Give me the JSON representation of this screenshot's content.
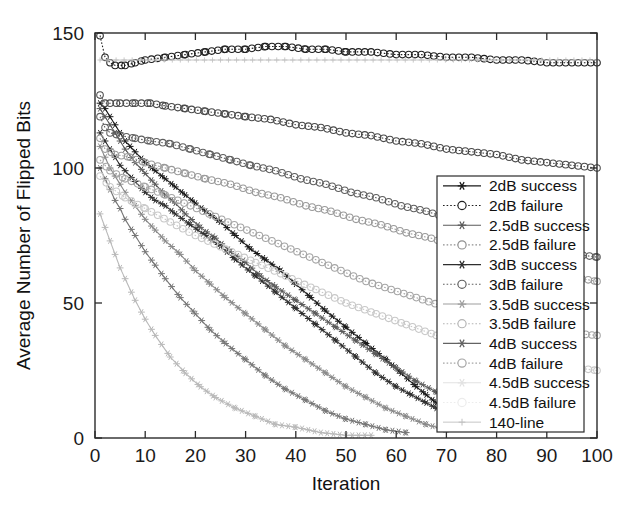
{
  "chart_data": {
    "type": "line",
    "title": "",
    "xlabel": "Iteration",
    "ylabel": "Average Number of Flipped Bits",
    "xlim": [
      0,
      100
    ],
    "ylim": [
      0,
      150
    ],
    "xticks": [
      "0",
      "10",
      "20",
      "30",
      "40",
      "50",
      "60",
      "70",
      "80",
      "90",
      "100"
    ],
    "yticks": [
      "0",
      "50",
      "100",
      "150"
    ],
    "grid": false,
    "legend_position": "right-center",
    "series": [
      {
        "name": "2dB success",
        "marker": "star",
        "linestyle": "solid",
        "color": "#1a1a1a",
        "x": [
          1,
          2,
          3,
          4,
          5,
          6,
          7,
          8,
          10,
          12,
          14,
          16,
          18,
          20,
          22,
          25,
          28,
          31,
          34,
          37,
          40,
          43,
          46,
          50,
          54,
          58,
          61,
          64,
          66,
          68
        ],
        "values": [
          124,
          122,
          119,
          116,
          113,
          110,
          108,
          106,
          102,
          99,
          96,
          93,
          90,
          87,
          84,
          80,
          75,
          70,
          66,
          62,
          57,
          52,
          47,
          41,
          35,
          29,
          24,
          19,
          16,
          13
        ]
      },
      {
        "name": "2dB failure",
        "marker": "circle",
        "linestyle": "dotted",
        "color": "#1f1f1f",
        "x": [
          1,
          2,
          3,
          4,
          6,
          8,
          10,
          14,
          18,
          22,
          26,
          30,
          34,
          38,
          42,
          46,
          50,
          55,
          60,
          65,
          70,
          75,
          80,
          85,
          90,
          95,
          100
        ],
        "values": [
          149,
          141,
          139,
          138,
          138,
          139,
          140,
          141,
          142,
          143,
          144,
          144,
          145,
          145,
          144,
          144,
          143,
          143,
          142,
          142,
          141,
          141,
          140,
          140,
          139,
          139,
          139
        ]
      },
      {
        "name": "2.5dB success",
        "marker": "star",
        "linestyle": "solid",
        "color": "#5a5a5a",
        "x": [
          1,
          2,
          3,
          4,
          5,
          6,
          8,
          10,
          12,
          14,
          16,
          18,
          21,
          24,
          27,
          30,
          33,
          36,
          40,
          44,
          48,
          52,
          56,
          60,
          64,
          68,
          72,
          76,
          80
        ],
        "values": [
          122,
          119,
          116,
          113,
          110,
          107,
          102,
          98,
          94,
          90,
          87,
          83,
          78,
          74,
          69,
          65,
          60,
          56,
          51,
          46,
          41,
          36,
          31,
          26,
          21,
          17,
          13,
          10,
          7
        ]
      },
      {
        "name": "2.5dB failure",
        "marker": "circle",
        "linestyle": "dotted",
        "color": "#4a4a4a",
        "x": [
          1,
          2,
          3,
          5,
          8,
          11,
          14,
          18,
          22,
          26,
          30,
          35,
          40,
          45,
          50,
          55,
          60,
          65,
          70,
          75,
          80,
          85,
          90,
          95,
          100
        ],
        "values": [
          127,
          124,
          124,
          124,
          124,
          124,
          123,
          122,
          121,
          120,
          119,
          118,
          116,
          115,
          113,
          112,
          110,
          109,
          107,
          106,
          105,
          103,
          102,
          101,
          100
        ]
      },
      {
        "name": "3dB success",
        "marker": "star",
        "linestyle": "solid",
        "color": "#2e2e2e",
        "x": [
          1,
          2,
          3,
          4,
          5,
          6,
          8,
          10,
          12,
          14,
          16,
          19,
          22,
          25,
          28,
          32,
          36,
          40,
          44,
          48,
          52,
          56,
          60,
          63,
          66,
          68
        ],
        "values": [
          113,
          110,
          107,
          104,
          101,
          99,
          95,
          91,
          88,
          86,
          83,
          79,
          75,
          71,
          66,
          60,
          54,
          48,
          42,
          36,
          30,
          24,
          19,
          16,
          13,
          11
        ]
      },
      {
        "name": "3dB failure",
        "marker": "circle",
        "linestyle": "dotted",
        "color": "#5f5f5f",
        "x": [
          1,
          2,
          3,
          5,
          8,
          11,
          15,
          19,
          23,
          27,
          31,
          36,
          41,
          46,
          51,
          56,
          61,
          66,
          71,
          76,
          81,
          86,
          91,
          96,
          100
        ],
        "values": [
          119,
          115,
          113,
          112,
          111,
          110,
          109,
          107,
          105,
          103,
          101,
          99,
          96,
          94,
          91,
          89,
          86,
          84,
          81,
          79,
          76,
          73,
          70,
          68,
          67
        ]
      },
      {
        "name": "3.5dB success",
        "marker": "star",
        "linestyle": "solid",
        "color": "#8a8a8a",
        "x": [
          1,
          2,
          3,
          4,
          5,
          6,
          8,
          10,
          12,
          14,
          17,
          20,
          23,
          26,
          30,
          34,
          38,
          42,
          46,
          50,
          54,
          58,
          62,
          66,
          70
        ],
        "values": [
          108,
          104,
          100,
          97,
          94,
          91,
          86,
          81,
          77,
          73,
          68,
          62,
          57,
          52,
          46,
          40,
          34,
          29,
          24,
          19,
          15,
          11,
          8,
          5,
          3
        ]
      },
      {
        "name": "3.5dB failure",
        "marker": "circle",
        "linestyle": "dotted",
        "color": "#9a9a9a",
        "x": [
          1,
          2,
          4,
          7,
          10,
          14,
          18,
          22,
          27,
          32,
          37,
          42,
          47,
          52,
          57,
          62,
          67,
          72,
          77,
          82,
          87,
          92,
          97,
          100
        ],
        "values": [
          111,
          107,
          105,
          104,
          102,
          100,
          98,
          96,
          94,
          91,
          89,
          86,
          84,
          81,
          79,
          76,
          74,
          71,
          68,
          66,
          63,
          61,
          59,
          58
        ]
      },
      {
        "name": "4dB success",
        "marker": "star",
        "linestyle": "solid",
        "color": "#777777",
        "x": [
          1,
          2,
          3,
          4,
          5,
          6,
          8,
          10,
          12,
          14,
          17,
          20,
          23,
          26,
          30,
          34,
          38,
          42,
          46,
          50,
          54,
          58,
          62
        ],
        "values": [
          100,
          96,
          92,
          88,
          85,
          81,
          75,
          69,
          64,
          59,
          52,
          46,
          40,
          35,
          29,
          23,
          18,
          14,
          10,
          7,
          5,
          3,
          2
        ]
      },
      {
        "name": "4dB failure",
        "marker": "circle",
        "linestyle": "dotted",
        "color": "#a5a5a5",
        "x": [
          1,
          3,
          6,
          10,
          14,
          19,
          24,
          29,
          34,
          39,
          44,
          49,
          54,
          59,
          64,
          69,
          74,
          79,
          84,
          89,
          94,
          100
        ],
        "values": [
          103,
          99,
          96,
          93,
          90,
          86,
          82,
          78,
          74,
          70,
          66,
          62,
          58,
          55,
          52,
          49,
          46,
          44,
          42,
          40,
          39,
          38
        ]
      },
      {
        "name": "4.5dB success",
        "marker": "star",
        "linestyle": "solid",
        "color": "#b9b9b9",
        "x": [
          1,
          2,
          3,
          4,
          5,
          6,
          8,
          10,
          12,
          15,
          18,
          21,
          24,
          28,
          32,
          36,
          40,
          45,
          50,
          55
        ],
        "values": [
          83,
          78,
          73,
          68,
          63,
          59,
          51,
          44,
          38,
          30,
          24,
          19,
          15,
          11,
          8,
          5,
          4,
          2,
          1,
          1
        ]
      },
      {
        "name": "4.5dB failure",
        "marker": "circle",
        "linestyle": "dotted",
        "color": "#c8c8c8",
        "x": [
          1,
          3,
          6,
          10,
          15,
          20,
          26,
          32,
          38,
          44,
          50,
          56,
          62,
          68,
          74,
          80,
          86,
          92,
          100
        ],
        "values": [
          97,
          93,
          89,
          85,
          80,
          75,
          70,
          65,
          60,
          55,
          50,
          46,
          42,
          38,
          35,
          32,
          29,
          27,
          25
        ]
      },
      {
        "name": "140-line",
        "marker": "plus",
        "linestyle": "solid",
        "color": "#c0c0c0",
        "x": [
          1,
          100
        ],
        "values": [
          140,
          140
        ]
      }
    ]
  },
  "legend": {
    "items": [
      {
        "label": "2dB success",
        "marker": "star",
        "style": "solid",
        "color": "#1a1a1a"
      },
      {
        "label": "2dB failure",
        "marker": "circle",
        "style": "dotted",
        "color": "#1f1f1f"
      },
      {
        "label": "2.5dB success",
        "marker": "star",
        "style": "solid",
        "color": "#5a5a5a"
      },
      {
        "label": "2.5dB failure",
        "marker": "circle",
        "style": "dotted",
        "color": "#8f8f8f"
      },
      {
        "label": "3dB success",
        "marker": "star",
        "style": "solid",
        "color": "#2e2e2e"
      },
      {
        "label": "3dB failure",
        "marker": "circle",
        "style": "dotted",
        "color": "#5f5f5f"
      },
      {
        "label": "3.5dB success",
        "marker": "star",
        "style": "solid",
        "color": "#9d9d9d"
      },
      {
        "label": "3.5dB failure",
        "marker": "circle",
        "style": "dotted",
        "color": "#b4b4b4"
      },
      {
        "label": "4dB success",
        "marker": "star",
        "style": "solid",
        "color": "#636363"
      },
      {
        "label": "4dB failure",
        "marker": "circle",
        "style": "dotted",
        "color": "#a5a5a5"
      },
      {
        "label": "4.5dB success",
        "marker": "star",
        "style": "solid",
        "color": "#e2e2e2"
      },
      {
        "label": "4.5dB failure",
        "marker": "circle",
        "style": "dotted",
        "color": "#ececec"
      },
      {
        "label": "140-line",
        "marker": "plus",
        "style": "solid",
        "color": "#c0c0c0"
      }
    ]
  }
}
